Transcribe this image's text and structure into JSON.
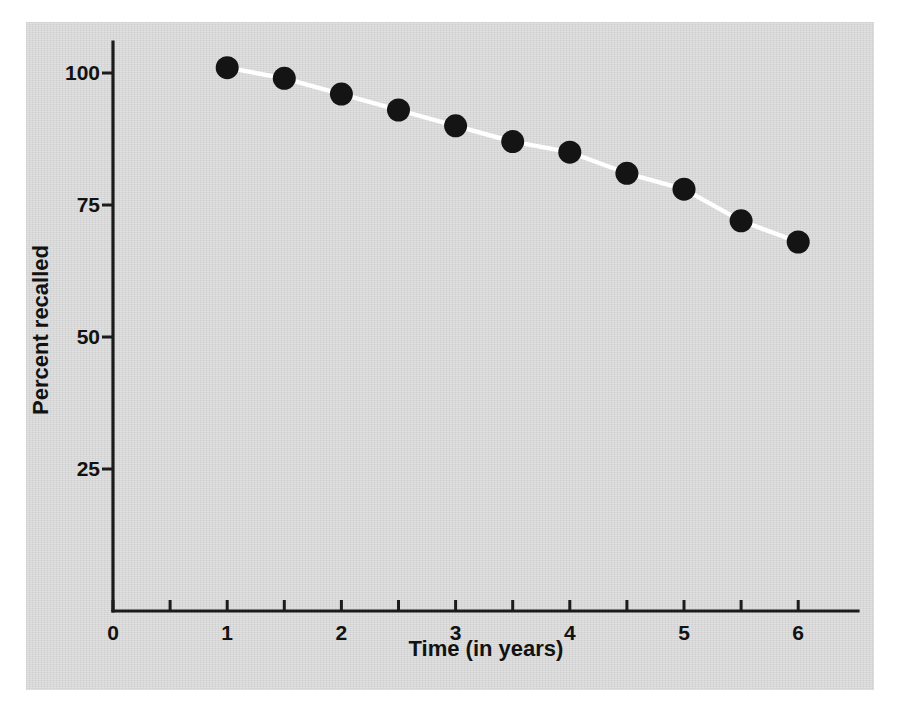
{
  "chart_data": {
    "type": "line",
    "title": "",
    "subtitle": "",
    "xlabel": "Time (in years)",
    "ylabel": "Percent recalled",
    "x": [
      1,
      1.5,
      2,
      2.5,
      3,
      3.5,
      4,
      4.5,
      5,
      5.5,
      6
    ],
    "values": [
      101,
      99,
      96,
      93,
      90,
      87,
      85,
      81,
      78,
      72,
      68
    ],
    "series": [
      {
        "name": "Percent recalled",
        "x": [
          1,
          1.5,
          2,
          2.5,
          3,
          3.5,
          4,
          4.5,
          5,
          5.5,
          6
        ],
        "values": [
          101,
          99,
          96,
          93,
          90,
          87,
          85,
          81,
          78,
          72,
          68
        ]
      }
    ],
    "xlim": [
      0,
      6.35
    ],
    "ylim": [
      13.2,
      110
    ],
    "xticks_major": [
      0,
      1,
      2,
      3,
      4,
      5,
      6
    ],
    "xtick_labels": [
      "0",
      "1",
      "2",
      "3",
      "4",
      "5",
      "6"
    ],
    "xticks_minor": [
      0.5,
      1.5,
      2.5,
      3.5,
      4.5,
      5.5
    ],
    "yticks": [
      25,
      50,
      75,
      100
    ],
    "ytick_labels": [
      "25",
      "50",
      "75",
      "100"
    ],
    "grid": false,
    "legend": "none",
    "line_color": "#ffffff",
    "marker_color": "#141414",
    "marker_shape": "circle",
    "axis_color": "#1b1b1b",
    "panel_color": "#d7d7d7",
    "page_color": "#ffffff"
  },
  "axes": {
    "x_title": "Time (in years)",
    "y_title": "Percent recalled"
  }
}
